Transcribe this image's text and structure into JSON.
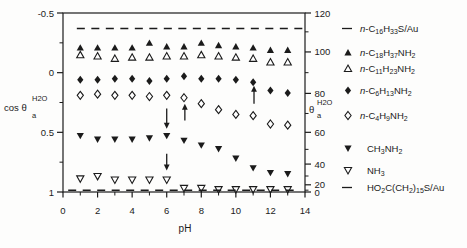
{
  "figure": {
    "xlabel": "pH",
    "left_axis_label": {
      "prefix": "cos θ",
      "sub": "a",
      "sup": "H2O"
    },
    "right_axis_label": {
      "prefix": "θ",
      "sub": "a",
      "sup": "H2O"
    }
  },
  "chart_data": {
    "type": "scatter",
    "title": "",
    "xlabel": "pH",
    "x_range": [
      0,
      14
    ],
    "x_major_ticks": [
      0,
      2,
      4,
      6,
      8,
      10,
      12,
      14
    ],
    "x_minor_ticks": [
      1,
      3,
      5,
      7,
      9,
      11,
      13
    ],
    "left_axis": {
      "label": "cos theta_a_H2O",
      "range": [
        -0.5,
        1
      ],
      "inverted": true,
      "major_ticks": [
        -0.5,
        0,
        0.5,
        1
      ],
      "minor_ticks": [
        -0.25,
        0.25,
        0.75
      ]
    },
    "right_axis": {
      "label": "theta_a_H2O (degrees)",
      "major_ticks": [
        120,
        100,
        80,
        60,
        40,
        20,
        0
      ],
      "minor_ticks": [
        110,
        90,
        70,
        50,
        30,
        10
      ],
      "mapping": "theta tick placed at left-axis position of cos(theta)"
    },
    "series": [
      {
        "name": "n-C16H33S/Au",
        "marker": "dash",
        "style": "dashed-line",
        "cos_theta": -0.37,
        "ph_span": [
          0.8,
          13.9
        ]
      },
      {
        "name": "n-C18H37NH2",
        "marker": "triangle-up-filled",
        "points": [
          [
            1,
            -0.21
          ],
          [
            2,
            -0.21
          ],
          [
            3,
            -0.21
          ],
          [
            4,
            -0.21
          ],
          [
            5,
            -0.25
          ],
          [
            6,
            -0.22
          ],
          [
            7,
            -0.22
          ],
          [
            8,
            -0.25
          ],
          [
            9,
            -0.23
          ],
          [
            10,
            -0.22
          ],
          [
            11,
            -0.21
          ],
          [
            12,
            -0.19
          ],
          [
            13,
            -0.19
          ]
        ]
      },
      {
        "name": "n-C11H23NH2",
        "marker": "triangle-up-open",
        "points": [
          [
            1,
            -0.15
          ],
          [
            2,
            -0.14
          ],
          [
            3,
            -0.12
          ],
          [
            4,
            -0.13
          ],
          [
            5,
            -0.13
          ],
          [
            6,
            -0.14
          ],
          [
            7,
            -0.14
          ],
          [
            8,
            -0.15
          ],
          [
            9,
            -0.14
          ],
          [
            10,
            -0.13
          ],
          [
            11,
            -0.12
          ],
          [
            12,
            -0.09
          ],
          [
            13,
            -0.09
          ]
        ]
      },
      {
        "name": "n-C6H13NH2",
        "marker": "diamond-filled",
        "points": [
          [
            1,
            0.06
          ],
          [
            2,
            0.06
          ],
          [
            3,
            0.05
          ],
          [
            4,
            0.05
          ],
          [
            5,
            0.07
          ],
          [
            6,
            0.05
          ],
          [
            7,
            0.03
          ],
          [
            8,
            0.05
          ],
          [
            9,
            0.05
          ],
          [
            10,
            0.06
          ],
          [
            11,
            0.08
          ],
          [
            12,
            0.15
          ],
          [
            13,
            0.17
          ]
        ]
      },
      {
        "name": "n-C4H9NH2",
        "marker": "diamond-open",
        "points": [
          [
            1,
            0.19
          ],
          [
            2,
            0.18
          ],
          [
            3,
            0.19
          ],
          [
            4,
            0.19
          ],
          [
            5,
            0.2
          ],
          [
            6,
            0.19
          ],
          [
            7,
            0.21
          ],
          [
            8,
            0.26
          ],
          [
            9,
            0.31
          ],
          [
            10,
            0.35
          ],
          [
            11,
            0.36
          ],
          [
            12,
            0.43
          ],
          [
            13,
            0.44
          ]
        ]
      },
      {
        "name": "CH3NH2",
        "marker": "triangle-down-filled",
        "points": [
          [
            1,
            0.53
          ],
          [
            2,
            0.56
          ],
          [
            3,
            0.56
          ],
          [
            4,
            0.56
          ],
          [
            5,
            0.55
          ],
          [
            6,
            0.53
          ],
          [
            7,
            0.57
          ],
          [
            8,
            0.61
          ],
          [
            9,
            0.64
          ],
          [
            10,
            0.72
          ],
          [
            11,
            0.8
          ],
          [
            12,
            0.84
          ],
          [
            13,
            0.85
          ]
        ]
      },
      {
        "name": "NH3",
        "marker": "triangle-down-open",
        "points": [
          [
            1,
            0.89
          ],
          [
            2,
            0.87
          ],
          [
            3,
            0.9
          ],
          [
            4,
            0.9
          ],
          [
            5,
            0.9
          ],
          [
            6,
            0.9
          ],
          [
            7,
            0.97
          ],
          [
            8,
            0.97
          ],
          [
            9,
            0.98
          ],
          [
            10,
            0.98
          ],
          [
            11,
            0.98
          ],
          [
            12,
            0.98
          ],
          [
            13,
            0.98
          ]
        ]
      },
      {
        "name": "HO2C(CH2)15S/Au",
        "marker": "dash",
        "style": "dashed-line",
        "cos_theta": 0.985,
        "ph_span": [
          0.3,
          13.6
        ]
      }
    ],
    "annotations": {
      "arrows": [
        {
          "ph": 6.0,
          "cos_from": 0.3,
          "cos_to": 0.47,
          "direction": "down"
        },
        {
          "ph": 7.05,
          "cos_from": 0.4,
          "cos_to": 0.26,
          "direction": "up"
        },
        {
          "ph": 6.0,
          "cos_from": 0.68,
          "cos_to": 0.82,
          "direction": "down"
        },
        {
          "ph": 11.05,
          "cos_from": 0.26,
          "cos_to": 0.11,
          "direction": "up"
        }
      ]
    },
    "legend_position": "right"
  },
  "legend": {
    "items": [
      {
        "marker": "dash",
        "label": "n-C16H33S/Au"
      },
      {
        "marker": "triangle-up-filled",
        "label": "n-C18H37NH2"
      },
      {
        "marker": "triangle-up-open",
        "label": "n-C11H23NH2"
      },
      {
        "marker": "diamond-filled",
        "label": "n-C6H13NH2"
      },
      {
        "marker": "diamond-open",
        "label": "n-C4H9NH2"
      },
      {
        "marker": "triangle-down-filled",
        "label": "CH3NH2"
      },
      {
        "marker": "triangle-down-open",
        "label": "NH3"
      },
      {
        "marker": "dash",
        "label": "HO2C(CH2)15S/Au"
      }
    ]
  }
}
